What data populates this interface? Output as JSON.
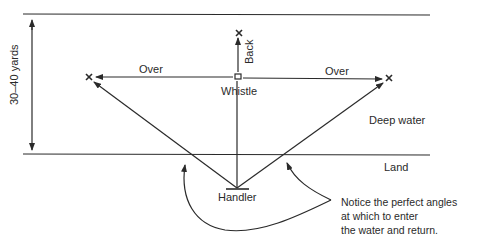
{
  "diagram": {
    "labels": {
      "distance": "30–40 yards",
      "back": "Back",
      "over_left": "Over",
      "over_right": "Over",
      "whistle": "Whistle",
      "deep_water": "Deep water",
      "land": "Land",
      "handler": "Handler"
    },
    "note": {
      "lines": [
        "Notice the perfect angles",
        "at which to enter",
        "the water and return."
      ]
    },
    "colors": {
      "ink": "#2a2a2a",
      "background": "#ffffff"
    }
  }
}
